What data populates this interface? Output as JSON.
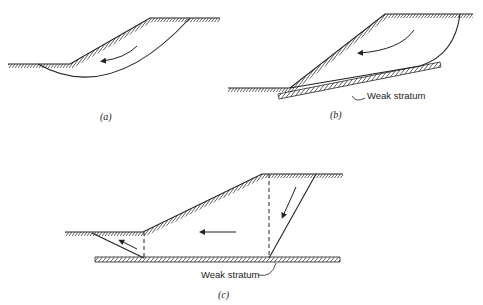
{
  "figure": {
    "panels": [
      {
        "id": "a",
        "caption": "(a)",
        "mechanism": "circular slip surface"
      },
      {
        "id": "b",
        "caption": "(b)",
        "mechanism": "composite slip along weak stratum",
        "label": "Weak stratum"
      },
      {
        "id": "c",
        "caption": "(c)",
        "mechanism": "wedge / block slide on weak stratum",
        "label": "Weak stratum"
      }
    ],
    "colors": {
      "line": "#222222",
      "background": "#ffffff"
    }
  }
}
